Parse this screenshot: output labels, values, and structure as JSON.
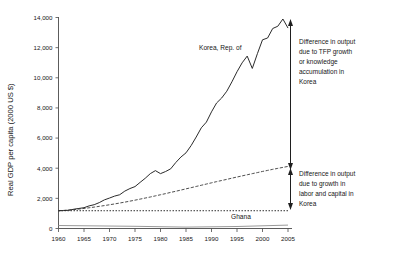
{
  "chart_data": {
    "type": "line",
    "title": "",
    "xlabel": "",
    "ylabel": "Real GDP per capita (2000 US $)",
    "xlim": [
      1960,
      2005
    ],
    "ylim": [
      0,
      14000
    ],
    "grid": false,
    "legend": "inline-annotations",
    "xticks": [
      "1960",
      "1965",
      "1970",
      "1975",
      "1980",
      "1985",
      "1990",
      "1995",
      "2000",
      "2005"
    ],
    "yticks": [
      "0",
      "2,000",
      "4,000",
      "6,000",
      "8,000",
      "10,000",
      "12,000",
      "14,000"
    ],
    "x": [
      1960,
      1961,
      1962,
      1963,
      1964,
      1965,
      1966,
      1967,
      1968,
      1969,
      1970,
      1971,
      1972,
      1973,
      1974,
      1975,
      1976,
      1977,
      1978,
      1979,
      1980,
      1981,
      1982,
      1983,
      1984,
      1985,
      1986,
      1987,
      1988,
      1989,
      1990,
      1991,
      1992,
      1993,
      1994,
      1995,
      1996,
      1997,
      1998,
      1999,
      2000,
      2001,
      2002,
      2003,
      2004,
      2005
    ],
    "series": [
      {
        "name": "Korea, Rep. of",
        "style": "solid",
        "values": [
          1180,
          1190,
          1210,
          1280,
          1330,
          1380,
          1500,
          1580,
          1720,
          1900,
          2020,
          2150,
          2240,
          2480,
          2650,
          2780,
          3060,
          3330,
          3640,
          3840,
          3640,
          3780,
          3960,
          4380,
          4740,
          5020,
          5500,
          6070,
          6680,
          7060,
          7740,
          8330,
          8660,
          9110,
          9730,
          10400,
          10990,
          11440,
          10620,
          11600,
          12520,
          12640,
          13270,
          13420,
          13900,
          13300
        ]
      },
      {
        "name": "Factor accumulation (labor and capital) counterfactual",
        "style": "dashed",
        "values": [
          1180,
          1200,
          1225,
          1255,
          1290,
          1330,
          1375,
          1420,
          1470,
          1520,
          1575,
          1630,
          1690,
          1750,
          1815,
          1880,
          1950,
          2020,
          2090,
          2165,
          2240,
          2315,
          2395,
          2470,
          2550,
          2630,
          2710,
          2790,
          2870,
          2950,
          3030,
          3110,
          3185,
          3260,
          3340,
          3415,
          3490,
          3565,
          3640,
          3710,
          3785,
          3855,
          3925,
          3990,
          4055,
          4120
        ]
      },
      {
        "name": "Ghana",
        "style": "dotted-horizontal",
        "values": [
          1180,
          1180,
          1180,
          1180,
          1180,
          1180,
          1180,
          1180,
          1180,
          1180,
          1180,
          1180,
          1180,
          1180,
          1180,
          1180,
          1180,
          1180,
          1180,
          1180,
          1180,
          1180,
          1180,
          1180,
          1180,
          1180,
          1180,
          1180,
          1180,
          1180,
          1180,
          1180,
          1180,
          1180,
          1180,
          1180,
          1180,
          1180,
          1180,
          1180,
          1180,
          1180,
          1180,
          1180,
          1180,
          1180
        ]
      }
    ],
    "annotations": [
      {
        "name": "korea-series-label",
        "text": "Korea, Rep. of"
      },
      {
        "name": "ghana-series-label",
        "text": "Ghana"
      },
      {
        "name": "tfp-annotation",
        "text": "Difference in output due to TFP growth or knowledge accumulation in Korea",
        "lines": [
          "Difference in output",
          "due to TFP growth",
          "or knowledge",
          "accumulation in",
          "Korea"
        ],
        "bracket_from": 4120,
        "bracket_to": 13300
      },
      {
        "name": "factor-annotation",
        "text": "Difference in output due to growth in labor and capital in Korea",
        "lines": [
          "Difference in output",
          "due to growth in",
          "labor and capital in",
          "Korea"
        ],
        "bracket_from": 1180,
        "bracket_to": 4120
      }
    ]
  },
  "axis": {
    "ylabel": "Real GDP per capita (2000 US $)",
    "yticks": [
      {
        "label": "14,000",
        "value": 14000
      },
      {
        "label": "12,000",
        "value": 12000
      },
      {
        "label": "10,000",
        "value": 10000
      },
      {
        "label": "8,000",
        "value": 8000
      },
      {
        "label": "6,000",
        "value": 6000
      },
      {
        "label": "4,000",
        "value": 4000
      },
      {
        "label": "2,000",
        "value": 2000
      },
      {
        "label": "0",
        "value": 0
      }
    ],
    "xticks": [
      {
        "label": "1960",
        "value": 1960
      },
      {
        "label": "1965",
        "value": 1965
      },
      {
        "label": "1970",
        "value": 1970
      },
      {
        "label": "1975",
        "value": 1975
      },
      {
        "label": "1980",
        "value": 1980
      },
      {
        "label": "1985",
        "value": 1985
      },
      {
        "label": "1990",
        "value": 1990
      },
      {
        "label": "1995",
        "value": 1995
      },
      {
        "label": "2000",
        "value": 2000
      },
      {
        "label": "2005",
        "value": 2005
      }
    ]
  },
  "labels": {
    "korea": "Korea, Rep. of",
    "ghana": "Ghana",
    "tfp_l1": "Difference in output",
    "tfp_l2": "due to TFP growth",
    "tfp_l3": "or knowledge",
    "tfp_l4": "accumulation in",
    "tfp_l5": "Korea",
    "fac_l1": "Difference in output",
    "fac_l2": "due to growth in",
    "fac_l3": "labor and capital in",
    "fac_l4": "Korea"
  },
  "colors": {
    "korea_line": "#2b2b2b",
    "factor_line": "#3a3a3a",
    "ghana_line": "#2f2f2f",
    "ghana_solid": "#9a9a9a",
    "axis": "#4a4a4a",
    "text": "#161616",
    "background": "#ffffff"
  }
}
